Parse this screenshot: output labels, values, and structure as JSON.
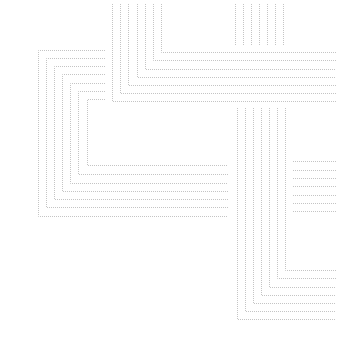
{
  "canvas": {
    "width": 342,
    "height": 347,
    "background": "#ffffff"
  },
  "style": {
    "stroke": "#c4c4c4",
    "stroke_width": 1,
    "dash": "1 1"
  },
  "groups": [
    {
      "name": "top-left-corner-group",
      "type": "L-bottom-left",
      "lines": [
        {
          "x": 112,
          "y_top": 4,
          "y_corner": 101,
          "x_end": 336
        },
        {
          "x": 120,
          "y_top": 4,
          "y_corner": 93,
          "x_end": 336
        },
        {
          "x": 128,
          "y_top": 4,
          "y_corner": 85,
          "x_end": 336
        },
        {
          "x": 137,
          "y_top": 4,
          "y_corner": 77,
          "x_end": 336
        },
        {
          "x": 145,
          "y_top": 4,
          "y_corner": 69,
          "x_end": 336
        },
        {
          "x": 153,
          "y_top": 4,
          "y_corner": 60,
          "x_end": 336
        },
        {
          "x": 161,
          "y_top": 4,
          "y_corner": 52,
          "x_end": 336
        }
      ]
    },
    {
      "name": "top-right-vertical-stubs",
      "type": "vertical",
      "lines": [
        {
          "x": 235,
          "y1": 4,
          "y2": 45
        },
        {
          "x": 243,
          "y1": 4,
          "y2": 45
        },
        {
          "x": 251,
          "y1": 4,
          "y2": 45
        },
        {
          "x": 259,
          "y1": 4,
          "y2": 45
        },
        {
          "x": 267,
          "y1": 4,
          "y2": 45
        },
        {
          "x": 275,
          "y1": 4,
          "y2": 45
        },
        {
          "x": 283,
          "y1": 4,
          "y2": 45
        }
      ]
    },
    {
      "name": "left-bracket-group",
      "type": "bracket-open-right",
      "lines": [
        {
          "x": 38,
          "y_top": 50,
          "y_bottom": 216,
          "x_top_end": 105,
          "x_bottom_end": 228
        },
        {
          "x": 46,
          "y_top": 58,
          "y_bottom": 207,
          "x_top_end": 105,
          "x_bottom_end": 228
        },
        {
          "x": 54,
          "y_top": 66,
          "y_bottom": 199,
          "x_top_end": 105,
          "x_bottom_end": 228
        },
        {
          "x": 62,
          "y_top": 74,
          "y_bottom": 191,
          "x_top_end": 105,
          "x_bottom_end": 228
        },
        {
          "x": 70,
          "y_top": 83,
          "y_bottom": 183,
          "x_top_end": 105,
          "x_bottom_end": 228
        },
        {
          "x": 78,
          "y_top": 91,
          "y_bottom": 174,
          "x_top_end": 105,
          "x_bottom_end": 228
        },
        {
          "x": 87,
          "y_top": 99,
          "y_bottom": 165,
          "x_top_end": 105,
          "x_bottom_end": 228
        }
      ]
    },
    {
      "name": "bottom-right-corner-group",
      "type": "L-bottom-left",
      "lines": [
        {
          "x": 237,
          "y_top": 108,
          "y_corner": 319,
          "x_end": 336
        },
        {
          "x": 245,
          "y_top": 108,
          "y_corner": 311,
          "x_end": 336
        },
        {
          "x": 253,
          "y_top": 108,
          "y_corner": 303,
          "x_end": 336
        },
        {
          "x": 261,
          "y_top": 108,
          "y_corner": 295,
          "x_end": 336
        },
        {
          "x": 269,
          "y_top": 108,
          "y_corner": 287,
          "x_end": 336
        },
        {
          "x": 277,
          "y_top": 108,
          "y_corner": 278,
          "x_end": 336
        },
        {
          "x": 285,
          "y_top": 108,
          "y_corner": 270,
          "x_end": 336
        }
      ]
    },
    {
      "name": "right-horizontal-stubs",
      "type": "horizontal",
      "lines": [
        {
          "y": 161,
          "x1": 293,
          "x2": 336
        },
        {
          "y": 170,
          "x1": 293,
          "x2": 336
        },
        {
          "y": 178,
          "x1": 293,
          "x2": 336
        },
        {
          "y": 186,
          "x1": 293,
          "x2": 336
        },
        {
          "y": 195,
          "x1": 293,
          "x2": 336
        },
        {
          "y": 203,
          "x1": 293,
          "x2": 336
        },
        {
          "y": 211,
          "x1": 293,
          "x2": 336
        }
      ]
    }
  ]
}
